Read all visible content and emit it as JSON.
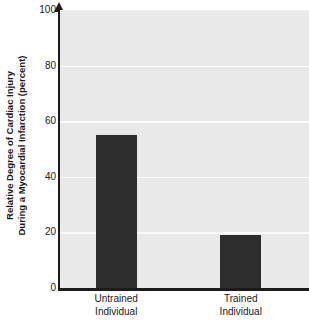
{
  "chart_data": {
    "type": "bar",
    "title": "",
    "subtitle": "",
    "xlabel": "",
    "ylabel": "Relative Degree of Cardiac Injury During a Myocardial Infarction (percent)",
    "ylabel_line1": "Relative Degree of Cardiac Injury",
    "ylabel_line2": "During a Myocardial Infarction (percent)",
    "categories": [
      "Untrained Individual",
      "Trained Individual"
    ],
    "category_lines": [
      {
        "line1": "Untrained",
        "line2": "Individual"
      },
      {
        "line1": "Trained",
        "line2": "Individual"
      }
    ],
    "values": [
      55,
      19
    ],
    "ylim": [
      0,
      100
    ],
    "ytick_values": [
      0,
      20,
      40,
      60,
      80,
      100
    ],
    "ytick_labels": [
      "0",
      "20",
      "40",
      "60",
      "80",
      "100"
    ],
    "grid": true,
    "grid_axis": "y",
    "legend": "none",
    "bar_color": "#2d2d2d",
    "plot_background": "#e9e9e9",
    "gridline_color": "#fbfbfb",
    "axis_color": "#1c1c1c",
    "text_color": "#1a1a1a",
    "y_axis_arrow": true
  }
}
